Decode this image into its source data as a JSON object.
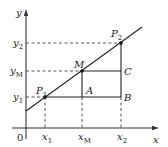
{
  "diagram": {
    "type": "coordinate-geometry",
    "axes": {
      "x_label": "x",
      "y_label": "y",
      "origin_label": "0"
    },
    "x_ticks": [
      {
        "id": "x1",
        "label": "x",
        "sub": "1"
      },
      {
        "id": "xM",
        "label": "x",
        "sub": "M"
      },
      {
        "id": "x2",
        "label": "x",
        "sub": "2"
      }
    ],
    "y_ticks": [
      {
        "id": "y2",
        "label": "y",
        "sub": "2"
      },
      {
        "id": "yM",
        "label": "y",
        "sub": "M"
      },
      {
        "id": "y1",
        "label": "y",
        "sub": "1"
      }
    ],
    "points": {
      "P1": {
        "label": "P",
        "sub": "1"
      },
      "M": {
        "label": "M"
      },
      "P2": {
        "label": "P",
        "sub": "2"
      },
      "A": {
        "label": "A"
      },
      "B": {
        "label": "B"
      },
      "C": {
        "label": "C"
      }
    }
  }
}
